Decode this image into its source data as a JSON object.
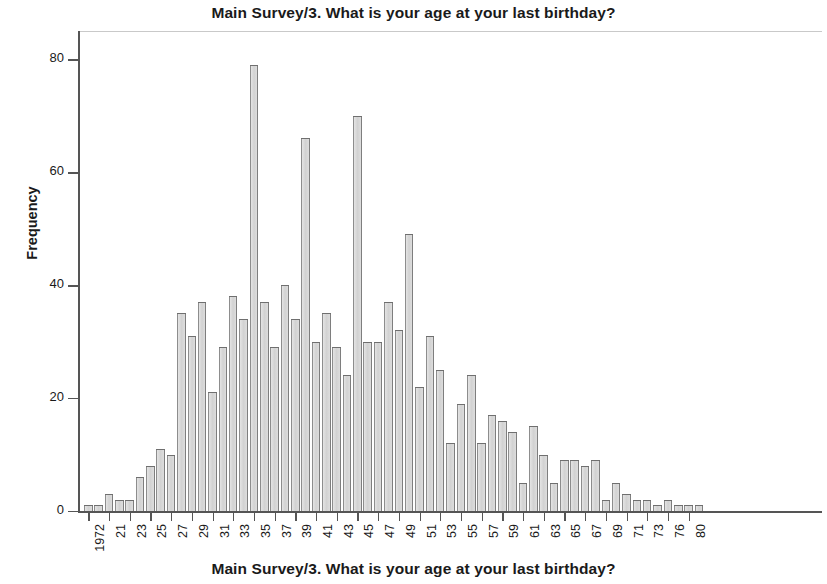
{
  "chart_data": {
    "type": "bar",
    "title": "Main Survey/3. What is your age at your last birthday?",
    "xlabel": "Main Survey/3. What is your age at your last birthday?",
    "ylabel": "Frequency",
    "ylim": [
      0,
      85
    ],
    "yticks": [
      0,
      20,
      40,
      60,
      80
    ],
    "grid": false,
    "legend": null,
    "xtick_labels": [
      "1972",
      "21",
      "23",
      "25",
      "27",
      "29",
      "31",
      "33",
      "35",
      "37",
      "39",
      "41",
      "43",
      "45",
      "47",
      "49",
      "51",
      "53",
      "55",
      "57",
      "59",
      "61",
      "63",
      "65",
      "67",
      "69",
      "71",
      "73",
      "76",
      "80"
    ],
    "categories": [
      "1972",
      "20",
      "21",
      "22",
      "23",
      "24",
      "25",
      "26",
      "27",
      "28",
      "29",
      "30",
      "31",
      "32",
      "33",
      "34",
      "35",
      "36",
      "37",
      "38",
      "39",
      "40",
      "41",
      "42",
      "43",
      "44",
      "45",
      "46",
      "47",
      "48",
      "49",
      "50",
      "51",
      "52",
      "53",
      "54",
      "55",
      "56",
      "57",
      "58",
      "59",
      "60",
      "61",
      "62",
      "63",
      "64",
      "65",
      "66",
      "67",
      "68",
      "69",
      "70",
      "71",
      "72",
      "73",
      "74",
      "76",
      "78",
      "80",
      "81"
    ],
    "values": [
      1,
      1,
      3,
      2,
      2,
      6,
      8,
      11,
      10,
      35,
      31,
      37,
      21,
      29,
      38,
      34,
      79,
      37,
      29,
      40,
      34,
      66,
      30,
      35,
      29,
      24,
      70,
      30,
      30,
      37,
      32,
      49,
      22,
      31,
      25,
      12,
      19,
      24,
      12,
      17,
      16,
      14,
      5,
      15,
      10,
      5,
      9,
      9,
      8,
      9,
      2,
      5,
      3,
      2,
      2,
      1,
      2,
      1,
      1,
      1
    ]
  },
  "axes": {
    "y_tick_labels": [
      "0",
      "20",
      "40",
      "60",
      "80"
    ]
  }
}
